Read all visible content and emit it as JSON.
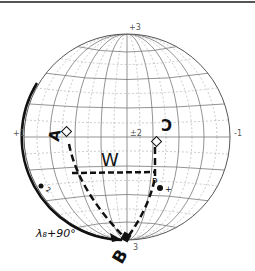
{
  "diagram": {
    "type": "sphere-projection",
    "axis_labels": {
      "top": "+3",
      "left": "+1",
      "center": "±2",
      "right": "-1",
      "bottom": "-3"
    },
    "point_labels": {
      "A": "A",
      "B": "B",
      "C": "C",
      "P": "P",
      "W": "W",
      "small_2": "2",
      "small_plus": "+",
      "small_3": "3"
    },
    "arc_label": "λ₈+90°",
    "colors": {
      "ink": "#111111",
      "grid": "#777777",
      "grid_dashed": "#aaaaaa",
      "frame": "#555555",
      "background": "#ffffff"
    }
  }
}
